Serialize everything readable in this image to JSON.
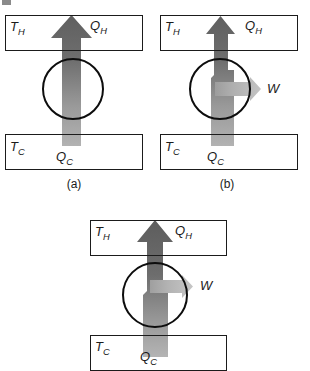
{
  "figure": {
    "background_color": "#ffffff",
    "line_color": "#1b1b1b",
    "arrow_dark_gray": "#6a6a6a",
    "arrow_light_gray": "#ababab",
    "work_arrow_gray": "#b0b0b0"
  },
  "panels": [
    {
      "id": "a",
      "caption": "(a)",
      "hot_reservoir_label": "T",
      "hot_reservoir_sub": "H",
      "cold_reservoir_label": "T",
      "cold_reservoir_sub": "C",
      "heat_in_label": "Q",
      "heat_in_sub": "H",
      "heat_out_label": "Q",
      "heat_out_sub": "C",
      "has_work_arrow": false,
      "work_label": ""
    },
    {
      "id": "b",
      "caption": "(b)",
      "hot_reservoir_label": "T",
      "hot_reservoir_sub": "H",
      "cold_reservoir_label": "T",
      "cold_reservoir_sub": "C",
      "heat_in_label": "Q",
      "heat_in_sub": "H",
      "heat_out_label": "Q",
      "heat_out_sub": "C",
      "has_work_arrow": true,
      "work_label": "W"
    },
    {
      "id": "c",
      "caption": "",
      "hot_reservoir_label": "T",
      "hot_reservoir_sub": "H",
      "cold_reservoir_label": "T",
      "cold_reservoir_sub": "C",
      "heat_in_label": "Q",
      "heat_in_sub": "H",
      "heat_out_label": "Q",
      "heat_out_sub": "C",
      "has_work_arrow": true,
      "work_label": "W"
    }
  ]
}
